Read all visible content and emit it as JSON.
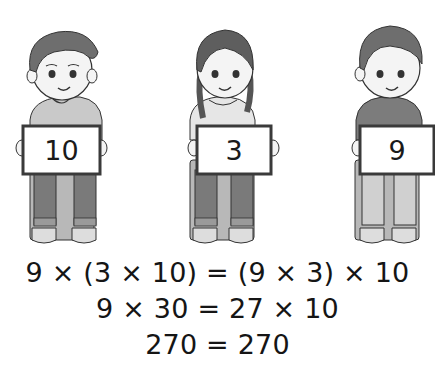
{
  "illustration": {
    "children": [
      {
        "name": "boy-left",
        "sign_value": "10"
      },
      {
        "name": "girl-middle",
        "sign_value": "3"
      },
      {
        "name": "boy-right",
        "sign_value": "9"
      }
    ]
  },
  "equations": [
    "9 × (3 × 10) = (9 × 3) × 10",
    "9 × 30 = 27 × 10",
    "270 = 270"
  ],
  "colors": {
    "ink": "#151515",
    "hair": "#6e6e6e",
    "skin": "#f4f4f4",
    "pants": "#7a7a7a",
    "sign_border": "#3a3a3a"
  }
}
